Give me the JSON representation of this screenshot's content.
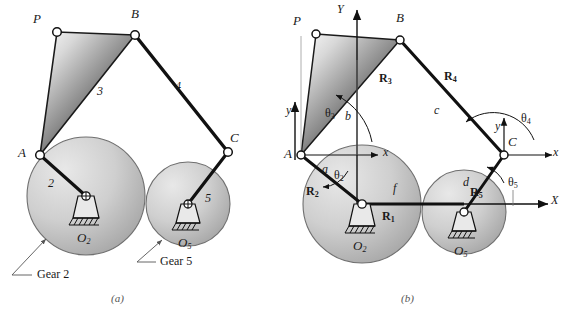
{
  "figure": {
    "type": "mechanism-kinematic-diagram",
    "subfigures": [
      {
        "id": "a",
        "caption": "(a)",
        "description": "geared five-bar linkage"
      },
      {
        "id": "b",
        "caption": "(b)",
        "description": "vector loop representation"
      }
    ]
  },
  "panel_a": {
    "points": {
      "P": "P",
      "B": "B",
      "A": "A",
      "C": "C"
    },
    "link_numbers": {
      "crank2": "2",
      "coupler3": "3",
      "link4": "4",
      "gear5": "5"
    },
    "ground_labels": {
      "o2": "O",
      "o2_sub": "2",
      "o5": "O",
      "o5_sub": "5"
    },
    "callouts": [
      {
        "text": "Gear 2",
        "name": "gear-2-callout"
      },
      {
        "text": "Gear 5",
        "name": "gear-5-callout"
      }
    ],
    "caption": "(a)"
  },
  "panel_b": {
    "points": {
      "P": "P",
      "B": "B",
      "A": "A",
      "C": "C"
    },
    "global_axes": {
      "x": "X",
      "y": "Y"
    },
    "local_axes": {
      "x": "x",
      "y": "y"
    },
    "vectors": [
      {
        "label": "R",
        "sub": "1",
        "name": "vector-r1"
      },
      {
        "label": "R",
        "sub": "2",
        "name": "vector-r2"
      },
      {
        "label": "R",
        "sub": "3",
        "name": "vector-r3"
      },
      {
        "label": "R",
        "sub": "4",
        "name": "vector-r4"
      },
      {
        "label": "R",
        "sub": "5",
        "name": "vector-r5"
      }
    ],
    "lengths": [
      {
        "label": "a",
        "name": "length-a"
      },
      {
        "label": "b",
        "name": "length-b"
      },
      {
        "label": "c",
        "name": "length-c"
      },
      {
        "label": "d",
        "name": "length-d"
      },
      {
        "label": "f",
        "name": "length-f"
      }
    ],
    "angles": [
      {
        "label": "θ",
        "sub": "2",
        "name": "angle-theta2"
      },
      {
        "label": "θ",
        "sub": "3",
        "name": "angle-theta3"
      },
      {
        "label": "θ",
        "sub": "4",
        "name": "angle-theta4"
      },
      {
        "label": "θ",
        "sub": "5",
        "name": "angle-theta5"
      }
    ],
    "ground_labels": {
      "o2": "O",
      "o2_sub": "2",
      "o5": "O",
      "o5_sub": "5"
    },
    "caption": "(b)"
  },
  "colors": {
    "line": "#111111",
    "gear_fill_light": "#dcdcdc",
    "gear_fill_mid": "#b4b4b4",
    "gear_edge": "#6e6e6e",
    "coupler_dark": "#2a2a2a",
    "coupler_light": "#f0f0f0",
    "background": "#ffffff",
    "caption": "#555555"
  }
}
